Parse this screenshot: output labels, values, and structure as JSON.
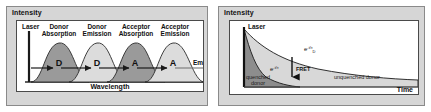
{
  "figure": {
    "panels": [
      {
        "id": "spectral-overlap-panel",
        "y_axis_label": "Intensity",
        "x_axis_label": "Wavelength",
        "laser_label": "Laser",
        "trailing_label": "Emission",
        "bands": [
          {
            "label": "Donor Absorption",
            "short": "D",
            "shade": "dark"
          },
          {
            "label": "Donor Emission",
            "short": "D",
            "shade": "light"
          },
          {
            "label": "Acceptor Absorption",
            "short": "A",
            "shade": "dark"
          },
          {
            "label": "Acceptor Emission",
            "short": "A",
            "shade": "light"
          }
        ]
      },
      {
        "id": "lifetime-decay-panel",
        "y_axis_label": "Intensity",
        "x_axis_label": "Time",
        "laser_label": "Laser",
        "curves": [
          {
            "name": "quenched donor",
            "label": "quenched donor",
            "exponent": "e",
            "exponent_sup": "-t/τ",
            "shade": "dark"
          },
          {
            "name": "unquenched donor",
            "label": "unquenched donor",
            "exponent": "e",
            "exponent_sup": "-t/τ",
            "exponent_sub": "D",
            "shade": "light"
          }
        ],
        "transfer_arrow_label": "FRET"
      }
    ],
    "colors": {
      "panel_background": "#d6d6d6",
      "plot_background": "#ffffff",
      "frame_border": "#4a4a4a",
      "dark_band": "#9a9a9a",
      "light_band": "#dcdcdc",
      "curve_stroke": "#1a1a1a",
      "text": "#111111"
    }
  }
}
